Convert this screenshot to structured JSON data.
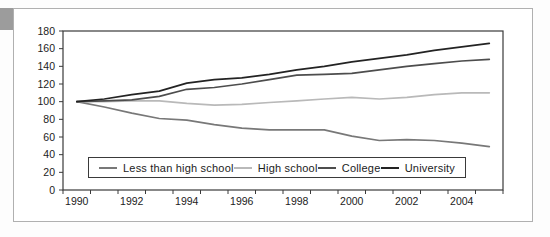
{
  "chart_data": {
    "type": "line",
    "title": "",
    "xlabel": "",
    "ylabel": "",
    "x": [
      1990,
      1991,
      1992,
      1993,
      1994,
      1995,
      1996,
      1997,
      1998,
      1999,
      2000,
      2001,
      2002,
      2003,
      2004,
      2005
    ],
    "series": [
      {
        "name": "Less than high school",
        "color": "#787878",
        "values": [
          100,
          94,
          87,
          81,
          79,
          74,
          70,
          68,
          68,
          68,
          61,
          56,
          57,
          56,
          53,
          49
        ]
      },
      {
        "name": "High school",
        "color": "#b9b9b9",
        "values": [
          100,
          100,
          101,
          101,
          98,
          96,
          97,
          99,
          101,
          103,
          105,
          103,
          105,
          108,
          110,
          110
        ]
      },
      {
        "name": "College",
        "color": "#4d4d4d",
        "values": [
          100,
          101,
          102,
          106,
          114,
          116,
          120,
          125,
          130,
          131,
          132,
          136,
          140,
          143,
          146,
          148
        ]
      },
      {
        "name": "University",
        "color": "#232323",
        "values": [
          100,
          103,
          108,
          112,
          121,
          125,
          127,
          131,
          136,
          140,
          145,
          149,
          153,
          158,
          162,
          166
        ]
      }
    ],
    "ylim": [
      0,
      180
    ],
    "y_tick_step": 20,
    "y_tick_labels": [
      "0",
      "20",
      "40",
      "60",
      "80",
      "100",
      "120",
      "140",
      "160",
      "180"
    ],
    "x_tick_labels": [
      "1990",
      "1992",
      "1994",
      "1996",
      "1998",
      "2000",
      "2002",
      "2004"
    ],
    "grid": false,
    "legend_position": "bottom-inside"
  },
  "colors": {
    "axis_line": "#3a3a3a",
    "tick_text": "#1c1c1c",
    "panel_border": "#b0b0b0",
    "accent_block": "#9c9c9c",
    "background": "#ffffff"
  }
}
